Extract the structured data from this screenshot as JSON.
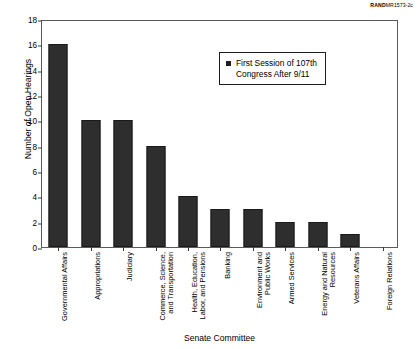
{
  "source_credit": {
    "brand": "RAND",
    "document_id": "MR1573-2c"
  },
  "chart_data": {
    "type": "bar",
    "title": "",
    "xlabel": "Senate Committee",
    "ylabel": "Number of Open Hearings",
    "ylim": [
      0,
      18
    ],
    "yticks": [
      0,
      2,
      4,
      6,
      8,
      10,
      12,
      14,
      16,
      18
    ],
    "grid": false,
    "legend_position": "upper-center-right",
    "bar_color": "#2e2e2e",
    "categories": [
      "Governmental Affairs",
      "Appropriations",
      "Judiciary",
      "Commerce, Science, and Transportation",
      "Health, Education, Labor, and Pensions",
      "Banking",
      "Environment and Public Works",
      "Armed Services",
      "Energy and Natural Resources",
      "Veterans Affairs",
      "Foreign Relations"
    ],
    "category_lines": [
      [
        "Governmental Affairs"
      ],
      [
        "Appropriations"
      ],
      [
        "Judiciary"
      ],
      [
        "Commerce, Science,",
        "and Transportation"
      ],
      [
        "Health, Education,",
        "Labor, and Pensions"
      ],
      [
        "Banking"
      ],
      [
        "Environment and",
        "Public Works"
      ],
      [
        "Armed Services"
      ],
      [
        "Energy and Natural",
        "Resources"
      ],
      [
        "Veterans Affairs"
      ],
      [
        "Foreign Relations"
      ]
    ],
    "series": [
      {
        "name": "First Session of 107th Congress After 9/11",
        "name_lines": [
          "First Session of 107th",
          "Congress After 9/11"
        ],
        "values": [
          16,
          10,
          10,
          8,
          4,
          3,
          3,
          2,
          2,
          1,
          0
        ]
      }
    ]
  }
}
